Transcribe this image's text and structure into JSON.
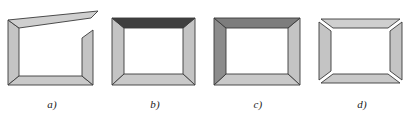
{
  "panel": {
    "title": "Picture frame assembly variants",
    "background_color": "#ffffff",
    "figure_count": 4
  },
  "palette": {
    "frame_light": "#cfcfcf",
    "frame_light_2": "#c4c4c4",
    "frame_midlight": "#bdbdbd",
    "frame_mid": "#a8a8a8",
    "frame_dark": "#8c8c8c",
    "frame_darkest": "#3f3f3f",
    "outline": "#3a3a3a",
    "inner_white": "#ffffff",
    "label_color": "#1a1a1a"
  },
  "figures": [
    {
      "id": "a",
      "label": "a)",
      "description": "Frame with top rail tilted upward to the right and overhanging the right stile",
      "top_rail_color": "#cfcfcf",
      "left_stile_color": "#c4c4c4",
      "right_stile_color": "#c4c4c4",
      "bottom_rail_color": "#c9c9c9",
      "corners_joined": false,
      "top_rail_slanted": true
    },
    {
      "id": "b",
      "label": "b)",
      "description": "Mitred frame with very dark top rail",
      "top_rail_color": "#3f3f3f",
      "left_stile_color": "#c4c4c4",
      "right_stile_color": "#c4c4c4",
      "bottom_rail_color": "#c9c9c9",
      "corners_joined": true,
      "top_rail_slanted": false
    },
    {
      "id": "c",
      "label": "c)",
      "description": "Mitred frame with dark top rail and medium grey left stile",
      "top_rail_color": "#7d7d7d",
      "left_stile_color": "#8c8c8c",
      "right_stile_color": "#c4c4c4",
      "bottom_rail_color": "#c9c9c9",
      "corners_joined": true,
      "top_rail_slanted": false
    },
    {
      "id": "d",
      "label": "d)",
      "description": "Four separate rails with open gaps at every corner",
      "top_rail_color": "#cfcfcf",
      "left_stile_color": "#c4c4c4",
      "right_stile_color": "#c4c4c4",
      "bottom_rail_color": "#c9c9c9",
      "corners_joined": false,
      "top_rail_slanted": false
    }
  ]
}
